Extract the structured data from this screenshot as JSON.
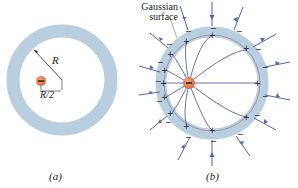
{
  "figure": {
    "panel_a": {
      "label": "(a)",
      "radius_label": "R",
      "offset_label": "R/2",
      "charge_sign": "−"
    },
    "panel_b": {
      "label": "(b)",
      "gaussian_label_line1": "Gaussian",
      "gaussian_label_line2": "surface",
      "charge_sign": "−"
    }
  },
  "colors": {
    "shell": "#b9cfdf",
    "field_line": "#5563a8",
    "charge": "#e07a4f",
    "text": "#222222"
  }
}
